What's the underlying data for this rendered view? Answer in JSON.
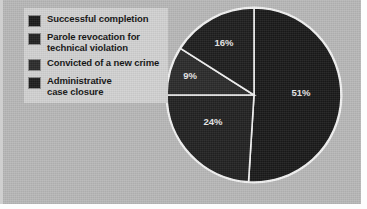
{
  "figure": {
    "background_color": "#b8b8b8",
    "legend_panel_color": "#d2d2d2"
  },
  "legend": {
    "items": [
      {
        "label": "Successful completion",
        "color": "#1a1a1a",
        "swatch_name": "legend-swatch-successful-completion"
      },
      {
        "label": "Parole revocation for\ntechnical violation",
        "color": "#222222",
        "swatch_name": "legend-swatch-parole-revocation"
      },
      {
        "label": "Convicted of a new crime",
        "color": "#2b2b2b",
        "swatch_name": "legend-swatch-convicted-new-crime"
      },
      {
        "label": "Administrative\ncase closure",
        "color": "#1e1e1e",
        "swatch_name": "legend-swatch-administrative-closure"
      }
    ]
  },
  "chart_data": {
    "type": "pie",
    "title": "",
    "subtitle": "",
    "xlabel": "",
    "ylabel": "",
    "grid": false,
    "legend_position": "left",
    "start_angle_deg": 0,
    "direction": "clockwise",
    "categories": [
      "Successful completion",
      "Parole revocation for technical violation",
      "Convicted of a new crime",
      "Administrative case closure"
    ],
    "values": [
      51,
      24,
      9,
      16
    ],
    "value_unit": "%",
    "data_labels": [
      "51%",
      "24%",
      "9%",
      "16%"
    ],
    "slice_colors": [
      "#1a1a1a",
      "#222222",
      "#2b2b2b",
      "#1e1e1e"
    ],
    "separator_color": "#f2f2f2",
    "label_color": "#e8e8e8",
    "slices": [
      {
        "label": "Successful completion",
        "value": 51,
        "display": "51%",
        "color": "#1a1a1a",
        "start_deg": 0,
        "end_deg": 183.6,
        "label_x": 301,
        "label_y": 96
      },
      {
        "label": "Parole revocation for technical violation",
        "value": 24,
        "display": "24%",
        "color": "#222222",
        "start_deg": 183.6,
        "end_deg": 270.0,
        "label_x": 213,
        "label_y": 125
      },
      {
        "label": "Convicted of a new crime",
        "value": 9,
        "display": "9%",
        "color": "#2b2b2b",
        "start_deg": 270.0,
        "end_deg": 302.4,
        "label_x": 190,
        "label_y": 79
      },
      {
        "label": "Administrative case closure",
        "value": 16,
        "display": "16%",
        "color": "#1e1e1e",
        "start_deg": 302.4,
        "end_deg": 360.0,
        "label_x": 224,
        "label_y": 46
      }
    ],
    "geometry": {
      "center_x": 254,
      "center_y": 95,
      "radius": 87
    }
  }
}
